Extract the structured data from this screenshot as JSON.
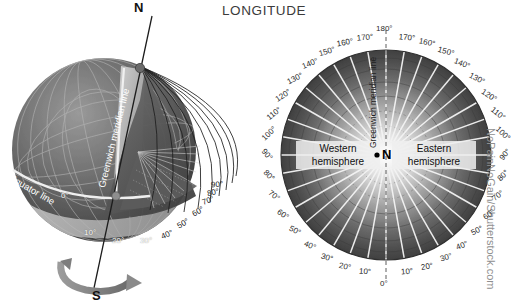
{
  "title": "LONGITUDE",
  "watermark": "NoPainNoGain/Shutterstock.com",
  "colors": {
    "background": "#ffffff",
    "title": "#3b3b3b",
    "label_dark": "#2a2a2a",
    "label_light": "#ffffff",
    "globe_dark": "#4a4a4a",
    "globe_mid": "#6e6e6e",
    "globe_light": "#b9b9b9",
    "watermark": "#8f8f8f"
  },
  "globe": {
    "north_pole_label": "N",
    "south_pole_label": "S",
    "equator_label": "Equator line",
    "meridian_label": "Greenwich meridian line",
    "zero_label": "0°",
    "degree_labels": [
      "10°",
      "20°",
      "30°",
      "40°",
      "50°",
      "60°",
      "70°",
      "80°",
      "90°"
    ],
    "rotation_arrow": "rotation-arrow"
  },
  "polar": {
    "center_label": "N",
    "meridian_label": "Greenwich meridian line",
    "western_line1": "Western",
    "western_line2": "hemisphere",
    "eastern_line1": "Eastern",
    "eastern_line2": "hemisphere",
    "top_label": "180°",
    "bottom_label": "0°",
    "west_labels": [
      "10°",
      "20°",
      "30°",
      "40°",
      "50°",
      "60°",
      "70°",
      "80°",
      "90°",
      "100°",
      "110°",
      "120°",
      "130°",
      "140°",
      "150°",
      "160°",
      "170°"
    ],
    "east_labels": [
      "10°",
      "20°",
      "30°",
      "40°",
      "50°",
      "60°",
      "70°",
      "80°",
      "90°",
      "100°",
      "110°",
      "120°",
      "130°",
      "140°",
      "150°",
      "160°",
      "170°"
    ]
  },
  "chart_data": {
    "type": "polar",
    "title": "LONGITUDE",
    "meridian_step_degrees": 10,
    "angular_range_degrees": [
      0,
      180
    ],
    "hemispheres": [
      "Western hemisphere",
      "Eastern hemisphere"
    ],
    "globe_meridian_ticks": [
      0,
      10,
      20,
      30,
      40,
      50,
      60,
      70,
      80,
      90
    ],
    "polar_meridian_ticks": [
      0,
      10,
      20,
      30,
      40,
      50,
      60,
      70,
      80,
      90,
      100,
      110,
      120,
      130,
      140,
      150,
      160,
      170,
      180
    ]
  }
}
